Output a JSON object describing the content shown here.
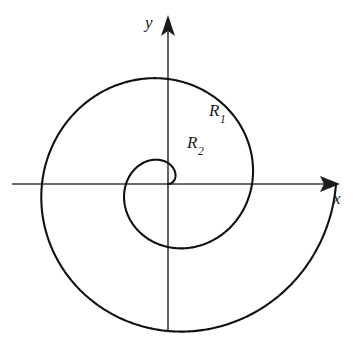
{
  "figure": {
    "background_color": "#ffffff",
    "curve_color": "#111111",
    "axis_color": "#3a3a3a",
    "width": 353,
    "height": 338
  },
  "axes": {
    "x_label": "x",
    "y_label": "y",
    "origin": {
      "x": 168,
      "y": 184
    },
    "x_start": {
      "x": 12,
      "y": 184
    },
    "x_end": {
      "x": 340,
      "y": 184
    },
    "y_start": {
      "x": 168,
      "y": 332
    },
    "y_end": {
      "x": 168,
      "y": 16
    },
    "x_arrow_name": "right-arrowhead",
    "y_arrow_name": "up-arrowhead"
  },
  "labels": [
    {
      "name": "region-label-r1",
      "base": "R",
      "subscript": "1",
      "x": 209,
      "y": 102
    },
    {
      "name": "region-label-r2",
      "base": "R",
      "subscript": "2",
      "x": 187,
      "y": 134
    }
  ],
  "chart_data": {
    "type": "line",
    "xlabel": "x",
    "ylabel": "y",
    "grid": false,
    "legend": "none",
    "curve_name": "archimedean-spiral",
    "turns": 2,
    "theta_start_deg": 0,
    "theta_end_deg": 720,
    "origin_px": {
      "x": 168,
      "y": 184
    },
    "pixels_per_half_turn": 42,
    "spiral_constant_a_px_per_rad": 13.37,
    "axis_crossings": {
      "positive_x": [
        168,
        210,
        252,
        294
      ],
      "negative_x": [
        147,
        105,
        63
      ],
      "positive_y_px": [
        155,
        113,
        71
      ],
      "negative_y_px": [
        226,
        268
      ]
    },
    "polar_points": [
      {
        "theta_deg": 0,
        "r_px": 0
      },
      {
        "theta_deg": 90,
        "r_px": 21
      },
      {
        "theta_deg": 180,
        "r_px": 42
      },
      {
        "theta_deg": 270,
        "r_px": 63
      },
      {
        "theta_deg": 360,
        "r_px": 84
      },
      {
        "theta_deg": 450,
        "r_px": 105
      },
      {
        "theta_deg": 540,
        "r_px": 126
      },
      {
        "theta_deg": 630,
        "r_px": 147
      },
      {
        "theta_deg": 720,
        "r_px": 168
      }
    ],
    "regions": [
      {
        "label": "R1",
        "description": "outer band between the second and third spiral arcs"
      },
      {
        "label": "R2",
        "description": "inner band between the first and second spiral arcs"
      }
    ]
  }
}
